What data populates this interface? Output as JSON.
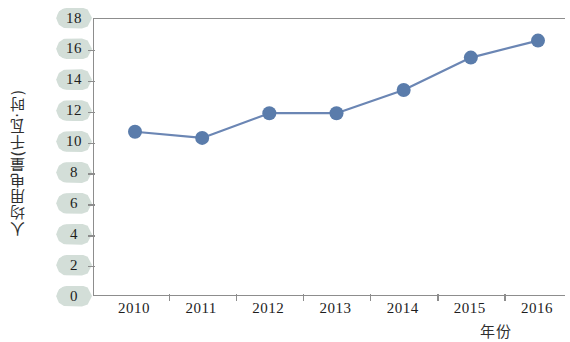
{
  "chart_data": {
    "type": "line",
    "title": "",
    "xlabel": "年份",
    "ylabel": "人均用电量(千瓦·时)",
    "categories": [
      "2010",
      "2011",
      "2012",
      "2013",
      "2014",
      "2015",
      "2016"
    ],
    "values": [
      10.7,
      10.3,
      11.9,
      11.9,
      13.4,
      15.5,
      16.6
    ],
    "series": [
      {
        "name": "人均用电量",
        "values": [
          10.7,
          10.3,
          11.9,
          11.9,
          13.4,
          15.5,
          16.6
        ]
      }
    ],
    "ylim": [
      0,
      18
    ],
    "y_ticks": [
      0,
      2,
      4,
      6,
      8,
      10,
      12,
      14,
      16,
      18
    ],
    "y_tick_labels": [
      "0",
      "2",
      "4",
      "6",
      "8",
      "10",
      "12",
      "14",
      "16",
      "18"
    ],
    "x_tick_labels": [
      "2010",
      "2011",
      "2012",
      "2013",
      "2014",
      "2015",
      "2016"
    ],
    "grid": false,
    "legend": null,
    "marker": "circle",
    "colors": {
      "line": "#6b86b4",
      "marker": "#5a7cab",
      "axis": "#8d8d8d",
      "tick_label_pill": "#cbd8d1",
      "text": "#1d1d1d",
      "background": "#ffffff"
    }
  }
}
